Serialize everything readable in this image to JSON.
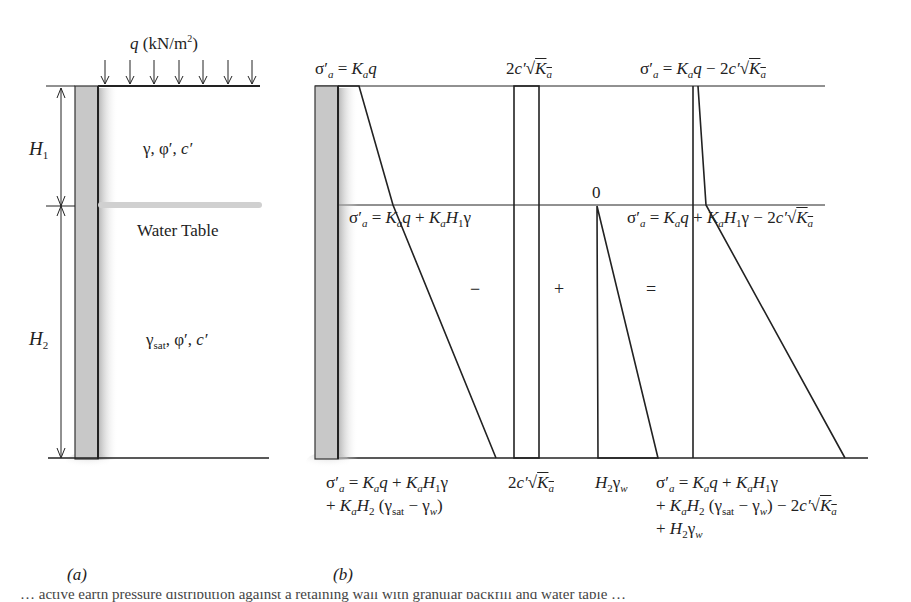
{
  "panel_a": {
    "surcharge_label": "q (kN/m²)",
    "surcharge_arrows": 7,
    "h1_label": "H1",
    "h2_label": "H2",
    "layer1_props": "γ, φ′, c′",
    "water_table_label": "Water Table",
    "layer2_props": "γsat, φ′, c′",
    "caption": "(a)"
  },
  "panel_b": {
    "top_left_eq": "σ′a = Kaq",
    "top_mid_eq": "2c′√Ka",
    "top_right_eq": "σ′a = Kaq − 2c′√Ka",
    "mid_left_eq": "σ′a = Kaq + KaH1γ",
    "mid_zero": "0",
    "mid_right_eq": "σ′a = Kaq + KaH1γ − 2c′√Ka",
    "op_minus": "−",
    "op_plus": "+",
    "op_equals": "=",
    "bottom_left_eq_line1": "σ′a = Kaq + KaH1γ",
    "bottom_left_eq_line2": "+ KaH2 (γsat − γw)",
    "bottom_mid_eq": "2c′√Ka",
    "bottom_water_eq": "H2γw",
    "bottom_right_eq_line1": "σ′a = Kaq + KaH1γ",
    "bottom_right_eq_line2": "+ KaH2 (γsat − γw) − 2c′√Ka",
    "bottom_right_eq_line3": "+ H2γw",
    "caption": "(b)"
  },
  "figure_caption_partial": "… active earth pressure distribution against a retaining wall with granular backfill and water table …",
  "colors": {
    "line": "#222222",
    "wall_fill": "#c8c8c8",
    "water_table": "#d0d0d0",
    "background": "#ffffff"
  }
}
